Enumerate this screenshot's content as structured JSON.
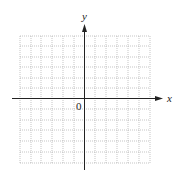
{
  "diagram": {
    "type": "coordinate-grid",
    "x_axis_label": "x",
    "y_axis_label": "y",
    "origin_label": "0",
    "grid": {
      "columns": 12,
      "rows": 12,
      "style": "dotted",
      "color": "#9a9a9a"
    },
    "axis_color": "#222222"
  }
}
